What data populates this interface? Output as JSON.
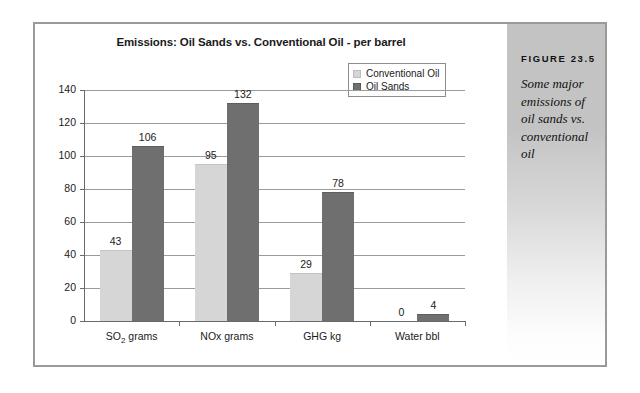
{
  "figure": {
    "number_label": "FIGURE 23.5",
    "caption": "Some major emissions of oil sands vs. conventional oil"
  },
  "chart_data": {
    "type": "bar",
    "title": "Emissions: Oil Sands vs. Conventional Oil - per barrel",
    "xlabel": "",
    "ylabel": "",
    "categories": [
      "SO₂ grams",
      "NOx grams",
      "GHG kg",
      "Water bbl"
    ],
    "series": [
      {
        "name": "Conventional Oil",
        "color": "#d6d6d6",
        "values": [
          43,
          95,
          29,
          0
        ]
      },
      {
        "name": "Oil Sands",
        "color": "#6f6f6f",
        "values": [
          106,
          132,
          78,
          4
        ]
      }
    ],
    "ylim": [
      0,
      140
    ],
    "yticks": [
      0,
      20,
      40,
      60,
      80,
      100,
      120,
      140
    ],
    "ytick_labels": [
      "0",
      "20",
      "40",
      "60",
      "80",
      "100",
      "120",
      "140"
    ],
    "grid": true,
    "legend_position": "top-right",
    "data_labels": true
  },
  "colors": {
    "frame_border": "#9a9a9a",
    "gridline": "#9b9b9b",
    "axis": "#6a6a6a",
    "sidebar_top": "#c3c3c3",
    "sidebar_bottom": "#ffffff",
    "text": "#1a1a1a"
  }
}
